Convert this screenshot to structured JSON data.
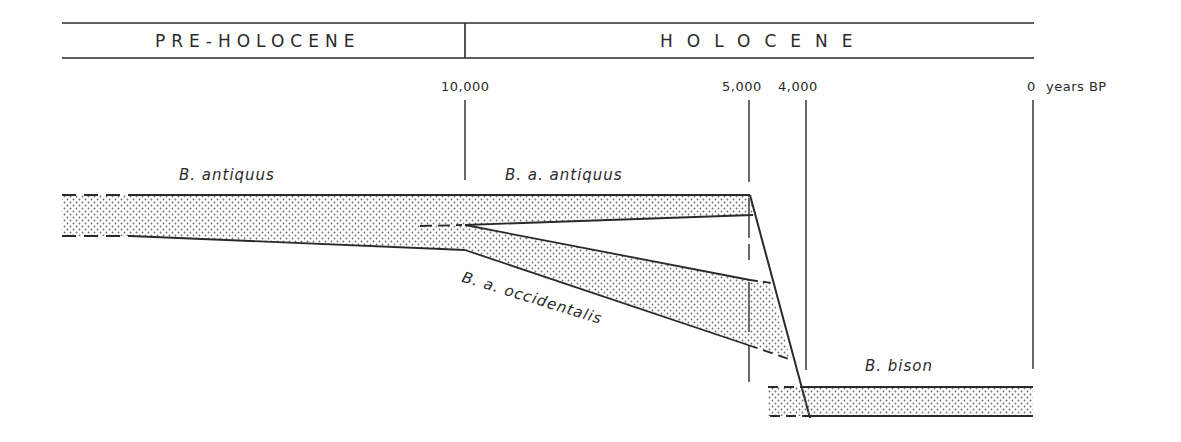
{
  "header": {
    "periods": [
      {
        "label": "PRE-HOLOCENE"
      },
      {
        "label": "HOLOCENE"
      }
    ]
  },
  "axis": {
    "ticks": [
      {
        "label": "10,000",
        "value": 10000
      },
      {
        "label": "5,000",
        "value": 5000
      },
      {
        "label": "4,000",
        "value": 4000
      },
      {
        "label": "0",
        "value": 0
      }
    ],
    "unit": "years BP"
  },
  "taxa": [
    {
      "label": "B. antiquus"
    },
    {
      "label": "B. a. antiquus"
    },
    {
      "label": "B. a. occidentalis"
    },
    {
      "label": "B. bison"
    }
  ],
  "colors": {
    "line": "#2a2a2a",
    "stipple": "#6a6a6a",
    "background": "#ffffff"
  }
}
